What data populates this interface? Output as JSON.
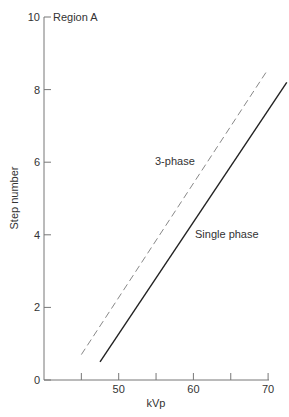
{
  "chart_data": {
    "type": "line",
    "title": "",
    "annotation": "Region A",
    "xlabel": "kVp",
    "ylabel": "Step number",
    "xlim": [
      40,
      72
    ],
    "ylim": [
      0,
      10
    ],
    "xticks": [
      45,
      50,
      55,
      60,
      65,
      70
    ],
    "xtick_labels": [
      "50",
      "60",
      "70"
    ],
    "yticks": [
      0,
      2,
      4,
      6,
      8,
      10
    ],
    "ytick_labels": [
      "0",
      "2",
      "4",
      "6",
      "8",
      "10"
    ],
    "grid": false,
    "legend": "inline labels",
    "series": [
      {
        "name": "3-phase",
        "style": "dashed",
        "x": [
          45,
          69.8
        ],
        "y": [
          0.7,
          8.5
        ]
      },
      {
        "name": "Single phase",
        "style": "solid",
        "x": [
          47.5,
          72.5
        ],
        "y": [
          0.5,
          8.2
        ]
      }
    ]
  }
}
